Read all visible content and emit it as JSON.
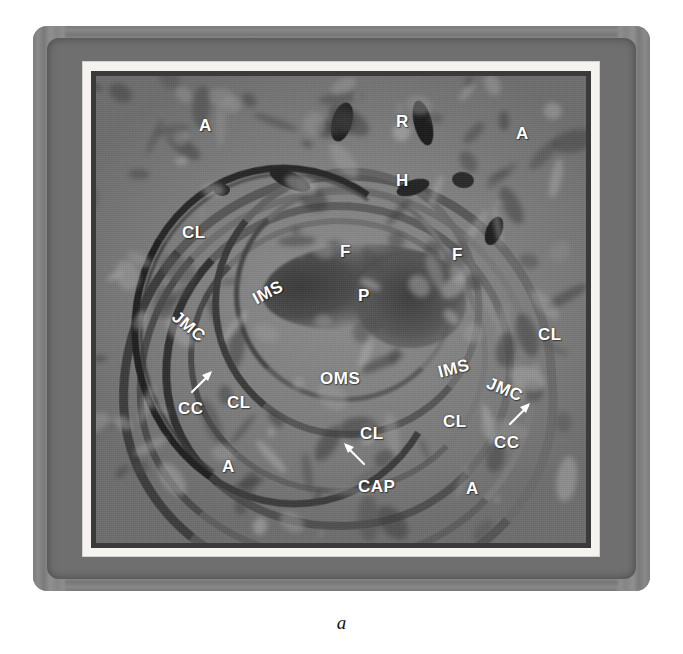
{
  "figure": {
    "panel_caption": "a",
    "kind": "electron-micrograph",
    "colors": {
      "label_text": "#ffffff",
      "plate_gray": "#8b8b8b",
      "frame_white": "#f4f3ef",
      "specimen_dark": "#3a3a3a",
      "caption_text": "#111111"
    }
  },
  "labels": [
    {
      "id": "a-top-left",
      "text": "A",
      "x": 199,
      "y": 117,
      "rotate": 0
    },
    {
      "id": "r-top",
      "text": "R",
      "x": 396,
      "y": 113,
      "rotate": 0
    },
    {
      "id": "a-top-right",
      "text": "A",
      "x": 516,
      "y": 125,
      "rotate": 0
    },
    {
      "id": "h-top",
      "text": "H",
      "x": 396,
      "y": 172,
      "rotate": 0
    },
    {
      "id": "cl-upper-left",
      "text": "CL",
      "x": 182,
      "y": 224,
      "rotate": 0
    },
    {
      "id": "f-center",
      "text": "F",
      "x": 340,
      "y": 243,
      "rotate": 0
    },
    {
      "id": "f-right",
      "text": "F",
      "x": 452,
      "y": 246,
      "rotate": 0
    },
    {
      "id": "ims-left",
      "text": "IMS",
      "x": 252,
      "y": 284,
      "rotate": -28
    },
    {
      "id": "p-center",
      "text": "P",
      "x": 358,
      "y": 287,
      "rotate": 0
    },
    {
      "id": "jmc-left",
      "text": "JMC",
      "x": 170,
      "y": 318,
      "rotate": 40
    },
    {
      "id": "cl-right-upper",
      "text": "CL",
      "x": 538,
      "y": 326,
      "rotate": 0
    },
    {
      "id": "oms-center",
      "text": "OMS",
      "x": 320,
      "y": 370,
      "rotate": 0
    },
    {
      "id": "ims-right",
      "text": "IMS",
      "x": 438,
      "y": 360,
      "rotate": -14
    },
    {
      "id": "jmc-right",
      "text": "JMC",
      "x": 486,
      "y": 381,
      "rotate": 22
    },
    {
      "id": "cc-left",
      "text": "CC",
      "x": 178,
      "y": 400,
      "rotate": 0
    },
    {
      "id": "cl-left-lower",
      "text": "CL",
      "x": 227,
      "y": 394,
      "rotate": 0
    },
    {
      "id": "cl-right-lower",
      "text": "CL",
      "x": 443,
      "y": 413,
      "rotate": 0
    },
    {
      "id": "cl-bottom",
      "text": "CL",
      "x": 360,
      "y": 425,
      "rotate": 0
    },
    {
      "id": "cc-right",
      "text": "CC",
      "x": 494,
      "y": 434,
      "rotate": 0
    },
    {
      "id": "a-bottom-left",
      "text": "A",
      "x": 222,
      "y": 458,
      "rotate": 0
    },
    {
      "id": "cap-bottom",
      "text": "CAP",
      "x": 358,
      "y": 478,
      "rotate": 0
    },
    {
      "id": "a-bottom-right",
      "text": "A",
      "x": 466,
      "y": 480,
      "rotate": 0
    }
  ],
  "arrows": [
    {
      "id": "arrow-to-cc-left",
      "points_to": "CC",
      "x": 190,
      "y": 368,
      "w": 26,
      "h": 26,
      "direction": "up-right"
    },
    {
      "id": "arrow-to-cc-right",
      "points_to": "CC",
      "x": 508,
      "y": 400,
      "w": 26,
      "h": 26,
      "direction": "up-right"
    },
    {
      "id": "arrow-to-cap",
      "points_to": "CAP",
      "x": 340,
      "y": 440,
      "w": 26,
      "h": 26,
      "direction": "up-left"
    }
  ],
  "legend_keys": [
    {
      "abbr": "A",
      "meaning": "A"
    },
    {
      "abbr": "R",
      "meaning": "R"
    },
    {
      "abbr": "H",
      "meaning": "H"
    },
    {
      "abbr": "F",
      "meaning": "F"
    },
    {
      "abbr": "P",
      "meaning": "P"
    },
    {
      "abbr": "CL",
      "meaning": "CL"
    },
    {
      "abbr": "CC",
      "meaning": "CC"
    },
    {
      "abbr": "CAP",
      "meaning": "CAP"
    },
    {
      "abbr": "IMS",
      "meaning": "IMS"
    },
    {
      "abbr": "OMS",
      "meaning": "OMS"
    },
    {
      "abbr": "JMC",
      "meaning": "JMC"
    }
  ]
}
